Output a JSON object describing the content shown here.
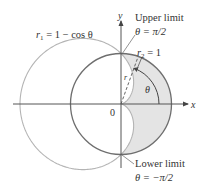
{
  "figure": {
    "axes": {
      "x_label": "x",
      "y_label": "y",
      "origin_label": "0"
    },
    "curves": {
      "cardioid": {
        "label_var": "r",
        "label_sub": "1",
        "label_rhs": " = 1 − cos θ",
        "stroke": "#b4b4b4"
      },
      "circle": {
        "label_var": "r",
        "label_sub": "2",
        "label_rhs": " = 1",
        "stroke": "#6e6e6e"
      }
    },
    "region": {
      "fill": "#e4e4e4"
    },
    "annotations": {
      "upper_title": "Upper limit",
      "upper_value": "θ = π/2",
      "lower_title": "Lower limit",
      "lower_value": "θ = −π/2",
      "angle_label": "θ",
      "radius_label": "r"
    }
  }
}
